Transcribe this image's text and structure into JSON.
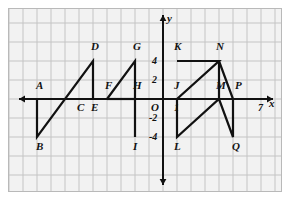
{
  "figure": {
    "kind": "coordinate-plane-diagram",
    "background_color": "#f2f2f2",
    "grid_color": "#c4c4c4",
    "axis_color": "#111111",
    "stroke_color": "#111111",
    "border_color": "#b9b9b9"
  },
  "axes": {
    "x_label": "x",
    "y_label": "y",
    "origin_label": "O",
    "x_ticks": [
      {
        "label": "1",
        "value": 1
      },
      {
        "label": "7",
        "value": 7
      }
    ],
    "y_ticks": [
      {
        "label": "4",
        "value": 4
      },
      {
        "label": "2",
        "value": 2
      },
      {
        "label": "-2",
        "value": -2
      },
      {
        "label": "-4",
        "value": -4
      }
    ],
    "x_range": [
      -10,
      8
    ],
    "y_range": [
      -6,
      6
    ],
    "unit_px_x": 14,
    "unit_px_y": 9.5,
    "grid_step_x": 1,
    "grid_step_y": 2
  },
  "points": [
    {
      "name": "A",
      "x": -9,
      "y": 0,
      "label_dx": -1,
      "label_dy": -11
    },
    {
      "name": "B",
      "x": -9,
      "y": -4,
      "label_dx": -1,
      "label_dy": 12
    },
    {
      "name": "C",
      "x": -6,
      "y": 0,
      "label_dx": -2,
      "label_dy": 11
    },
    {
      "name": "D",
      "x": -5,
      "y": 4,
      "label_dx": -2,
      "label_dy": -12
    },
    {
      "name": "E",
      "x": -5,
      "y": 0,
      "label_dx": -2,
      "label_dy": 11
    },
    {
      "name": "F",
      "x": -4,
      "y": 0,
      "label_dx": -2,
      "label_dy": -11
    },
    {
      "name": "G",
      "x": -2,
      "y": 4,
      "label_dx": -2,
      "label_dy": -12
    },
    {
      "name": "H",
      "x": -2,
      "y": 0,
      "label_dx": -2,
      "label_dy": -11
    },
    {
      "name": "I",
      "x": -2,
      "y": -4,
      "label_dx": -2,
      "label_dy": 12
    },
    {
      "name": "J",
      "x": 1,
      "y": 0,
      "label_dx": -3,
      "label_dy": -11
    },
    {
      "name": "K",
      "x": 1,
      "y": 4,
      "label_dx": -3,
      "label_dy": -12
    },
    {
      "name": "L",
      "x": 1,
      "y": -4,
      "label_dx": -3,
      "label_dy": 12
    },
    {
      "name": "M",
      "x": 4,
      "y": 0,
      "label_dx": -3,
      "label_dy": -11
    },
    {
      "name": "N",
      "x": 4,
      "y": 4,
      "label_dx": -3,
      "label_dy": -12
    },
    {
      "name": "P",
      "x": 5,
      "y": 0,
      "label_dx": 2,
      "label_dy": -11
    },
    {
      "name": "Q",
      "x": 5,
      "y": -4,
      "label_dx": -1,
      "label_dy": 12
    }
  ],
  "shapes": [
    {
      "name": "triangle-ABD-left",
      "points": [
        "A",
        "B",
        "D"
      ],
      "closed": false,
      "path": [
        [
          -9,
          0
        ],
        [
          -9,
          -4
        ],
        [
          -5,
          4
        ],
        [
          -5,
          0
        ]
      ]
    },
    {
      "name": "segment-A-F",
      "closed": false,
      "path": [
        [
          -9,
          0
        ],
        [
          -4,
          0
        ]
      ]
    },
    {
      "name": "triangle-FGI",
      "closed": false,
      "path": [
        [
          -4,
          0
        ],
        [
          -2,
          4
        ],
        [
          -2,
          -4
        ]
      ]
    },
    {
      "name": "segment-F-H",
      "closed": false,
      "path": [
        [
          -4,
          0
        ],
        [
          -2,
          0
        ]
      ]
    },
    {
      "name": "polyline-K-N-L-M-N",
      "closed": false,
      "path": [
        [
          1,
          4
        ],
        [
          4,
          4
        ],
        [
          1,
          0
        ],
        [
          1,
          -4
        ],
        [
          4,
          0
        ],
        [
          5,
          -4
        ],
        [
          5,
          0
        ],
        [
          4,
          4
        ]
      ]
    },
    {
      "name": "segment-J-P",
      "closed": false,
      "path": [
        [
          1,
          0
        ],
        [
          5,
          0
        ]
      ]
    },
    {
      "name": "segment-N-M",
      "closed": false,
      "path": [
        [
          4,
          4
        ],
        [
          4,
          0
        ]
      ]
    }
  ]
}
